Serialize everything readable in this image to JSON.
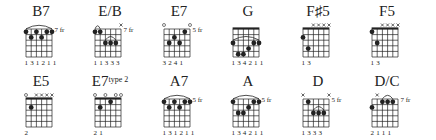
{
  "diagram": {
    "layout": {
      "columns": 6,
      "rows": 2
    },
    "colors": {
      "ink": "#222222",
      "background": "#ffffff"
    },
    "chords": [
      {
        "name": "B7",
        "suffix": "",
        "fret_label": "7 fr",
        "nut": false,
        "strings_state": [
          "",
          "",
          "",
          "",
          "",
          ""
        ],
        "dots": [
          [
            1,
            1
          ],
          [
            1,
            3
          ],
          [
            1,
            5
          ],
          [
            1,
            6
          ],
          [
            2,
            2
          ],
          [
            2,
            4
          ]
        ],
        "barre": {
          "fret": 1,
          "from": 1,
          "to": 6
        },
        "fingering": "1 3 1 2 1 1"
      },
      {
        "name": "E/B",
        "suffix": "",
        "fret_label": "7 fr",
        "nut": false,
        "strings_state": [
          "",
          "",
          "",
          "",
          "",
          "x"
        ],
        "dots": [
          [
            1,
            1
          ],
          [
            1,
            2
          ],
          [
            3,
            3
          ],
          [
            3,
            4
          ],
          [
            3,
            5
          ]
        ],
        "barre": {
          "fret": 3,
          "from": 3,
          "to": 5
        },
        "small_arc": {
          "fret": 1,
          "from": 1,
          "to": 2
        },
        "fingering": "1 1 3 3 3"
      },
      {
        "name": "E7",
        "suffix": "",
        "fret_label": "5 fr",
        "nut": false,
        "strings_state": [
          "o",
          "",
          "",
          "",
          "",
          "o"
        ],
        "dots": [
          [
            1,
            5
          ],
          [
            2,
            3
          ],
          [
            3,
            2
          ],
          [
            3,
            4
          ]
        ],
        "fingering": "3 2 4 1"
      },
      {
        "name": "G",
        "suffix": "",
        "fret_label": "",
        "nut": true,
        "strings_state": [
          "",
          "",
          "",
          "",
          "",
          ""
        ],
        "dots": [
          [
            3,
            1
          ],
          [
            3,
            5
          ],
          [
            3,
            6
          ],
          [
            4,
            4
          ],
          [
            5,
            2
          ],
          [
            5,
            3
          ]
        ],
        "barre": {
          "fret": 3,
          "from": 1,
          "to": 6
        },
        "fingering": "1 3 4 2 1 1"
      },
      {
        "name": "F♯5",
        "suffix": "",
        "fret_label": "",
        "nut": true,
        "strings_state": [
          "",
          "",
          "x",
          "x",
          "x",
          "x"
        ],
        "dots": [
          [
            2,
            1
          ],
          [
            4,
            2
          ]
        ],
        "fingering": "1 3"
      },
      {
        "name": "F5",
        "suffix": "",
        "fret_label": "",
        "nut": true,
        "strings_state": [
          "",
          "",
          "x",
          "x",
          "x",
          "x"
        ],
        "dots": [
          [
            1,
            1
          ],
          [
            3,
            2
          ]
        ],
        "fingering": "1 3"
      },
      {
        "name": "E5",
        "suffix": "",
        "fret_label": "",
        "nut": true,
        "strings_state": [
          "o",
          "",
          "x",
          "x",
          "x",
          "x"
        ],
        "dots": [
          [
            2,
            2
          ]
        ],
        "fingering": "2"
      },
      {
        "name": "E7",
        "suffix": "type 2",
        "fret_label": "",
        "nut": true,
        "strings_state": [
          "o",
          "",
          "o",
          "",
          "o",
          "o"
        ],
        "dots": [
          [
            2,
            2
          ],
          [
            1,
            4
          ]
        ],
        "fingering": "2 1"
      },
      {
        "name": "A7",
        "suffix": "",
        "fret_label": "5 fr",
        "nut": false,
        "strings_state": [
          "",
          "",
          "",
          "",
          "",
          ""
        ],
        "dots": [
          [
            1,
            1
          ],
          [
            1,
            3
          ],
          [
            1,
            5
          ],
          [
            1,
            6
          ],
          [
            2,
            2
          ],
          [
            2,
            4
          ]
        ],
        "barre": {
          "fret": 1,
          "from": 1,
          "to": 6
        },
        "fingering": "1 3 1 2 1 1"
      },
      {
        "name": "A",
        "suffix": "",
        "fret_label": "5 fr",
        "nut": false,
        "strings_state": [
          "",
          "",
          "",
          "",
          "",
          ""
        ],
        "dots": [
          [
            1,
            1
          ],
          [
            1,
            5
          ],
          [
            1,
            6
          ],
          [
            2,
            4
          ],
          [
            3,
            2
          ],
          [
            3,
            3
          ]
        ],
        "barre": {
          "fret": 1,
          "from": 1,
          "to": 6
        },
        "fingering": "1 3 4 2 1 1"
      },
      {
        "name": "D",
        "suffix": "",
        "fret_label": "5 fr",
        "nut": false,
        "strings_state": [
          "x",
          "",
          "",
          "",
          "",
          "x"
        ],
        "dots": [
          [
            1,
            2
          ],
          [
            3,
            3
          ],
          [
            3,
            4
          ],
          [
            3,
            5
          ]
        ],
        "barre": {
          "fret": 3,
          "from": 3,
          "to": 5
        },
        "fingering": "1 3 3 3"
      },
      {
        "name": "D/C",
        "suffix": "",
        "fret_label": "7 fr",
        "nut": false,
        "strings_state": [
          "",
          "x",
          "",
          "",
          "",
          ""
        ],
        "dots": [
          [
            2,
            1
          ],
          [
            1,
            3
          ],
          [
            1,
            4
          ],
          [
            1,
            5
          ]
        ],
        "barre": {
          "fret": 1,
          "from": 3,
          "to": 5
        },
        "fingering": "2   1 1 1"
      }
    ]
  }
}
